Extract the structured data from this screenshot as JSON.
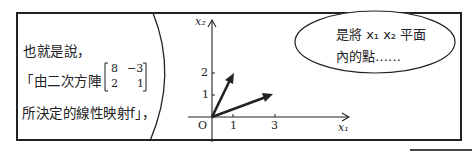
{
  "narration": {
    "line1": "也就是說，",
    "line2_prefix": "「由二次方陣",
    "matrix": [
      [
        "8",
        "−3"
      ],
      [
        "2",
        "1"
      ]
    ],
    "line3": "所決定的線性映射f」，"
  },
  "graph": {
    "x_axis_label": "x₁",
    "y_axis_label": "x₂",
    "origin_label": "O",
    "x_ticks": [
      "1",
      "3"
    ],
    "y_ticks": [
      "1",
      "2"
    ],
    "vectors": [
      {
        "from": [
          0,
          0
        ],
        "to": [
          1,
          2
        ]
      },
      {
        "from": [
          0,
          0
        ],
        "to": [
          3,
          1
        ]
      }
    ]
  },
  "speech_bubble": {
    "line1": "是將 x₁ x₂ 平面",
    "line2": "內的點……"
  }
}
